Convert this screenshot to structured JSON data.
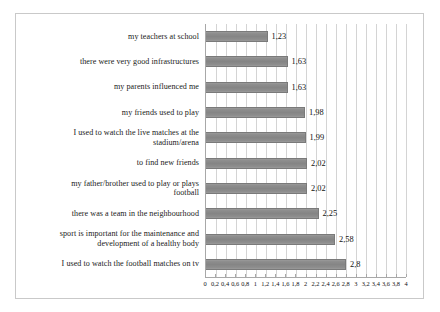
{
  "chart_data": {
    "type": "bar",
    "orientation": "horizontal",
    "title": "",
    "subtitle": "",
    "xlabel": "",
    "ylabel": "",
    "xlim": [
      0,
      4
    ],
    "grid": true,
    "legend": false,
    "decimal_separator": ",",
    "categories": [
      "my teachers at school",
      "there were very good infrastructures",
      "my parents influenced me",
      "my friends used to play",
      "I used to watch the live matches at the\nstadium/arena",
      "to find new friends",
      "my father/brother used to play or plays\nfootball",
      "there was a team in the neighbourhood",
      "sport is important for the maintenance and\ndevelopment of a healthy body",
      "I used to watch the football matches on tv"
    ],
    "values": [
      1.23,
      1.63,
      1.63,
      1.98,
      1.99,
      2.02,
      2.02,
      2.25,
      2.58,
      2.8
    ],
    "value_labels": [
      "1,23",
      "1,63",
      "1,63",
      "1,98",
      "1,99",
      "2,02",
      "2,02",
      "2,25",
      "2,58",
      "2,8"
    ],
    "xticks": [
      0,
      0.2,
      0.4,
      0.6,
      0.8,
      1,
      1.2,
      1.4,
      1.6,
      1.8,
      2,
      2.2,
      2.4,
      2.6,
      2.8,
      3,
      3.2,
      3.4,
      3.6,
      3.8,
      4
    ],
    "xtick_labels": [
      "0",
      "0,2",
      "0,4",
      "0,6",
      "0,8",
      "1",
      "1,2",
      "1,4",
      "1,6",
      "1,8",
      "2",
      "2,2",
      "2,4",
      "2,6",
      "2,8",
      "3",
      "3,2",
      "3,4",
      "3,6",
      "3,8",
      "4"
    ],
    "colors": {
      "bar_fill": "#8a8a8a",
      "bar_border": "#7a7a7a",
      "gridline": "#d4d4d4",
      "axis": "#a8a8a8",
      "frame": "#c9c9c9",
      "text": "#1a1a1a",
      "background": "#ffffff"
    }
  }
}
